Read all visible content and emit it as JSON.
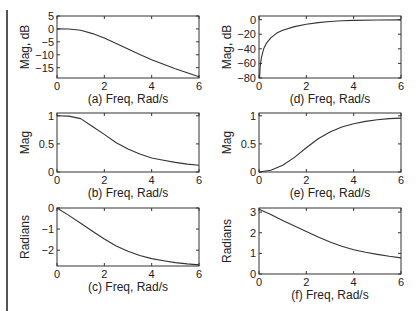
{
  "chart_data": [
    {
      "id": "a",
      "type": "line",
      "xlabel": "(a) Freq, Rad/s",
      "ylabel": "Mag, dB",
      "xlim": [
        0,
        6
      ],
      "ylim": [
        -19,
        5
      ],
      "xticks": [
        0,
        2,
        4,
        6
      ],
      "yticks": [
        5,
        0,
        -5,
        -10,
        -15
      ],
      "grid": false,
      "x": [
        0,
        0.5,
        1.0,
        1.5,
        2.0,
        2.5,
        3.0,
        3.5,
        4.0,
        4.5,
        5.0,
        5.5,
        6.0
      ],
      "values": [
        0,
        -0.05,
        -0.5,
        -1.8,
        -3.5,
        -5.6,
        -7.8,
        -9.9,
        -11.9,
        -13.7,
        -15.4,
        -17.0,
        -18.5
      ]
    },
    {
      "id": "b",
      "type": "line",
      "xlabel": "(b) Freq, Rad/s",
      "ylabel": "Mag",
      "xlim": [
        0,
        6
      ],
      "ylim": [
        0,
        1.05
      ],
      "xticks": [
        0,
        2,
        4,
        6
      ],
      "yticks": [
        1,
        0.5,
        0
      ],
      "grid": false,
      "x": [
        0,
        0.5,
        1.0,
        1.5,
        2.0,
        2.5,
        3.0,
        3.5,
        4.0,
        4.5,
        5.0,
        5.5,
        6.0
      ],
      "values": [
        1.0,
        0.995,
        0.95,
        0.81,
        0.67,
        0.52,
        0.41,
        0.32,
        0.25,
        0.21,
        0.17,
        0.14,
        0.12
      ]
    },
    {
      "id": "c",
      "type": "line",
      "xlabel": "(c) Freq, Rad/s",
      "ylabel": "Radians",
      "xlim": [
        0,
        6
      ],
      "ylim": [
        -2.75,
        0
      ],
      "xticks": [
        0,
        2,
        4,
        6
      ],
      "yticks": [
        0,
        -1,
        -2
      ],
      "grid": false,
      "x": [
        0,
        0.5,
        1.0,
        1.5,
        2.0,
        2.5,
        3.0,
        3.5,
        4.0,
        4.5,
        5.0,
        5.5,
        6.0
      ],
      "values": [
        0,
        -0.35,
        -0.72,
        -1.1,
        -1.47,
        -1.8,
        -2.05,
        -2.25,
        -2.4,
        -2.5,
        -2.59,
        -2.65,
        -2.7
      ]
    },
    {
      "id": "d",
      "type": "line",
      "xlabel": "(d) Freq, Rad/s",
      "ylabel": "Mag, dB",
      "xlim": [
        0,
        6
      ],
      "ylim": [
        -80,
        5
      ],
      "xticks": [
        0,
        2,
        4,
        6
      ],
      "yticks": [
        0,
        -20,
        -40,
        -60,
        -80
      ],
      "grid": false,
      "x": [
        0.02,
        0.05,
        0.1,
        0.2,
        0.3,
        0.5,
        0.75,
        1.0,
        1.5,
        2.0,
        2.5,
        3.0,
        3.5,
        4.0,
        5.0,
        6.0
      ],
      "values": [
        -80,
        -64,
        -52,
        -40,
        -33,
        -25,
        -18.5,
        -14.5,
        -9.5,
        -6.2,
        -4.0,
        -2.5,
        -1.6,
        -1.0,
        -0.5,
        -0.3
      ]
    },
    {
      "id": "e",
      "type": "line",
      "xlabel": "(e) Freq, Rad/s",
      "ylabel": "Mag",
      "xlim": [
        0,
        6
      ],
      "ylim": [
        0,
        1.05
      ],
      "xticks": [
        0,
        2,
        4,
        6
      ],
      "yticks": [
        1,
        0.5,
        0
      ],
      "grid": false,
      "x": [
        0,
        0.5,
        1.0,
        1.5,
        2.0,
        2.5,
        3.0,
        3.5,
        4.0,
        4.5,
        5.0,
        5.5,
        6.0
      ],
      "values": [
        0,
        0.03,
        0.12,
        0.26,
        0.43,
        0.59,
        0.71,
        0.8,
        0.86,
        0.9,
        0.93,
        0.95,
        0.96
      ]
    },
    {
      "id": "f",
      "type": "line",
      "xlabel": "(f) Freq, Rad/s",
      "ylabel": "Radians",
      "xlim": [
        0,
        6
      ],
      "ylim": [
        0,
        3.2
      ],
      "xticks": [
        0,
        2,
        4,
        6
      ],
      "yticks": [
        3,
        2,
        1,
        0
      ],
      "grid": false,
      "x": [
        0,
        0.5,
        1.0,
        1.5,
        2.0,
        2.5,
        3.0,
        3.5,
        4.0,
        4.5,
        5.0,
        5.5,
        6.0
      ],
      "values": [
        3.14,
        2.88,
        2.6,
        2.33,
        2.06,
        1.79,
        1.55,
        1.35,
        1.18,
        1.05,
        0.95,
        0.86,
        0.78
      ]
    }
  ]
}
